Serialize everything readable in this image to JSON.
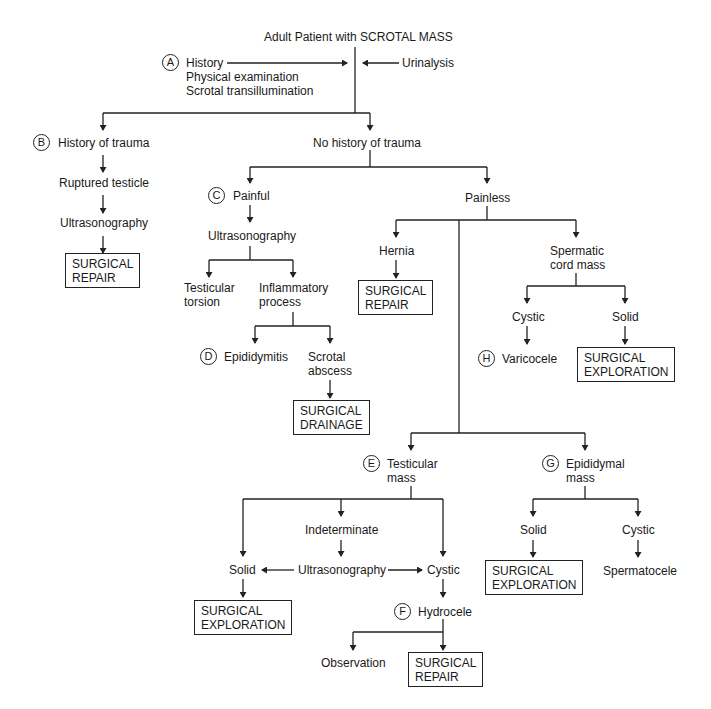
{
  "title": "Adult Patient with SCROTAL MASS",
  "steps": {
    "A": {
      "letter": "A",
      "lines": [
        "History",
        "Physical examination",
        "Scrotal transillumination"
      ],
      "side": "Urinalysis"
    },
    "B": {
      "letter": "B",
      "label": "History of trauma",
      "next": [
        "Ruptured testicle",
        "Ultrasonography"
      ],
      "action": "SURGICAL\nREPAIR"
    },
    "no_trauma": "No history of trauma",
    "C": {
      "letter": "C",
      "label": "Painful",
      "test": "Ultrasonography",
      "torsion": "Testicular\ntorsion",
      "inflammatory": "Inflammatory\nprocess"
    },
    "D": {
      "letter": "D",
      "label": "Epididymitis",
      "abscess": "Scrotal\nabscess",
      "action": "SURGICAL\nDRAINAGE"
    },
    "painless": "Painless",
    "hernia": {
      "label": "Hernia",
      "action": "SURGICAL\nREPAIR"
    },
    "spermatic": {
      "label": "Spermatic\ncord mass",
      "cystic": "Cystic",
      "solid": "Solid",
      "action": "SURGICAL\nEXPLORATION"
    },
    "H": {
      "letter": "H",
      "label": "Varicocele"
    },
    "E": {
      "letter": "E",
      "label": "Testicular\nmass",
      "indeterminate": "Indeterminate",
      "ultrasound": "Ultrasonography",
      "solid": "Solid",
      "cystic": "Cystic",
      "action": "SURGICAL\nEXPLORATION"
    },
    "F": {
      "letter": "F",
      "label": "Hydrocele",
      "observation": "Observation",
      "action": "SURGICAL\nREPAIR"
    },
    "G": {
      "letter": "G",
      "label": "Epididymal\nmass",
      "solid": "Solid",
      "cystic": "Cystic",
      "spermatocele": "Spermatocele",
      "action": "SURGICAL\nEXPLORATION"
    }
  },
  "colors": {
    "line": "#222222",
    "text": "#1a1a1a",
    "background": "#ffffff"
  }
}
